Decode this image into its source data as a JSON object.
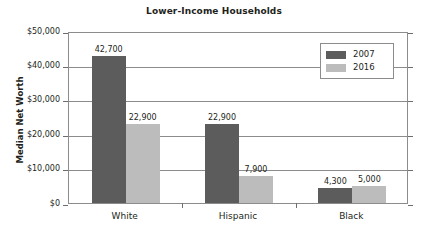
{
  "chart_data": {
    "type": "bar",
    "title": "Lower-Income Households",
    "xlabel": "",
    "ylabel": "Median Net Worth",
    "categories": [
      "White",
      "Hispanic",
      "Black"
    ],
    "series": [
      {
        "name": "2007",
        "color": "#5c5c5c",
        "values": [
          42700,
          22900,
          4300
        ],
        "labels": [
          "42,700",
          "22,900",
          "4,300"
        ]
      },
      {
        "name": "2016",
        "color": "#bcbcbc",
        "values": [
          22900,
          7900,
          5000
        ],
        "labels": [
          "22,900",
          "7,900",
          "5,000"
        ]
      }
    ],
    "ylim": [
      0,
      50000
    ],
    "yticks": [
      0,
      10000,
      20000,
      30000,
      40000,
      50000
    ],
    "ytick_labels": [
      "$0",
      "$10,000",
      "$20,000",
      "$30,000",
      "$40,000",
      "$50,000"
    ],
    "grid": true,
    "legend_position": "top-right"
  }
}
